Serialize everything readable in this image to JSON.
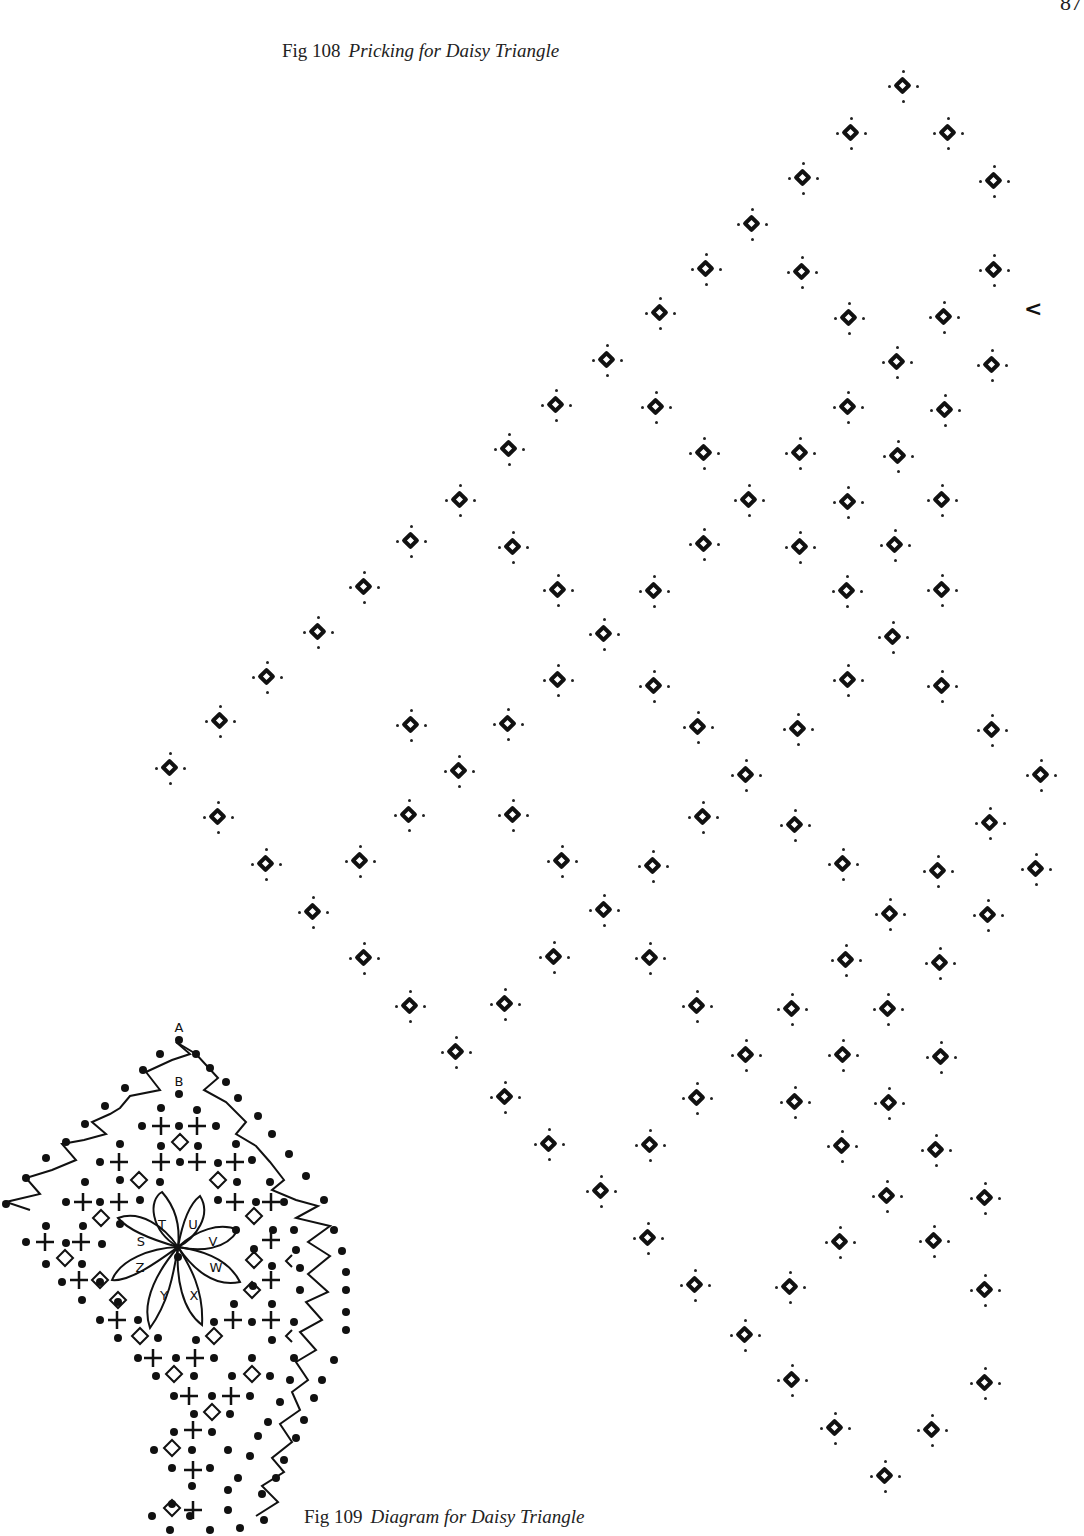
{
  "page": {
    "page_number": "87"
  },
  "figures": {
    "fig108": {
      "number": "Fig 108",
      "title": "Pricking for Daisy Triangle"
    },
    "fig109": {
      "number": "Fig 109",
      "title": "Diagram for Daisy Triangle"
    }
  },
  "pricking": {
    "colors": {
      "ink": "#111111",
      "paper": "#ffffff"
    },
    "diamonds": [
      [
        903,
        86
      ],
      [
        851,
        133
      ],
      [
        948,
        133
      ],
      [
        803,
        178
      ],
      [
        994,
        181
      ],
      [
        752,
        224
      ],
      [
        706,
        269
      ],
      [
        802,
        272
      ],
      [
        994,
        270
      ],
      [
        660,
        313
      ],
      [
        849,
        318
      ],
      [
        944,
        317
      ],
      [
        607,
        360
      ],
      [
        897,
        362
      ],
      [
        992,
        365
      ],
      [
        556,
        405
      ],
      [
        656,
        407
      ],
      [
        848,
        407
      ],
      [
        945,
        410
      ],
      [
        509,
        449
      ],
      [
        704,
        453
      ],
      [
        800,
        453
      ],
      [
        898,
        456
      ],
      [
        460,
        500
      ],
      [
        749,
        500
      ],
      [
        848,
        502
      ],
      [
        942,
        500
      ],
      [
        411,
        541
      ],
      [
        513,
        547
      ],
      [
        704,
        544
      ],
      [
        800,
        547
      ],
      [
        895,
        545
      ],
      [
        364,
        587
      ],
      [
        558,
        590
      ],
      [
        654,
        591
      ],
      [
        847,
        591
      ],
      [
        942,
        590
      ],
      [
        318,
        632
      ],
      [
        604,
        634
      ],
      [
        893,
        637
      ],
      [
        267,
        677
      ],
      [
        558,
        680
      ],
      [
        654,
        686
      ],
      [
        848,
        680
      ],
      [
        942,
        686
      ],
      [
        220,
        721
      ],
      [
        411,
        725
      ],
      [
        508,
        724
      ],
      [
        698,
        727
      ],
      [
        798,
        729
      ],
      [
        992,
        730
      ],
      [
        170,
        768
      ],
      [
        459,
        771
      ],
      [
        746,
        775
      ],
      [
        1041,
        775
      ],
      [
        218,
        817
      ],
      [
        409,
        815
      ],
      [
        513,
        815
      ],
      [
        703,
        817
      ],
      [
        795,
        825
      ],
      [
        990,
        823
      ],
      [
        266,
        864
      ],
      [
        360,
        861
      ],
      [
        562,
        861
      ],
      [
        653,
        866
      ],
      [
        843,
        864
      ],
      [
        938,
        871
      ],
      [
        1036,
        869
      ],
      [
        313,
        912
      ],
      [
        604,
        910
      ],
      [
        890,
        914
      ],
      [
        988,
        915
      ],
      [
        364,
        958
      ],
      [
        554,
        957
      ],
      [
        650,
        958
      ],
      [
        846,
        960
      ],
      [
        940,
        963
      ],
      [
        410,
        1006
      ],
      [
        505,
        1004
      ],
      [
        697,
        1006
      ],
      [
        792,
        1009
      ],
      [
        888,
        1009
      ],
      [
        456,
        1052
      ],
      [
        746,
        1055
      ],
      [
        843,
        1055
      ],
      [
        941,
        1057
      ],
      [
        505,
        1097
      ],
      [
        697,
        1098
      ],
      [
        795,
        1102
      ],
      [
        889,
        1103
      ],
      [
        549,
        1144
      ],
      [
        650,
        1145
      ],
      [
        842,
        1146
      ],
      [
        936,
        1150
      ],
      [
        601,
        1191
      ],
      [
        887,
        1196
      ],
      [
        985,
        1198
      ],
      [
        648,
        1238
      ],
      [
        840,
        1242
      ],
      [
        934,
        1241
      ],
      [
        695,
        1285
      ],
      [
        790,
        1287
      ],
      [
        985,
        1290
      ],
      [
        745,
        1335
      ],
      [
        792,
        1380
      ],
      [
        985,
        1383
      ],
      [
        835,
        1428
      ],
      [
        932,
        1430
      ],
      [
        885,
        1476
      ]
    ],
    "chevrons": [
      {
        "glyph": "<",
        "x": 1030,
        "y": 310
      }
    ]
  },
  "diagram": {
    "labels": [
      "A",
      "B",
      "T",
      "U",
      "V",
      "W",
      "X",
      "Y",
      "Z",
      "S"
    ]
  }
}
